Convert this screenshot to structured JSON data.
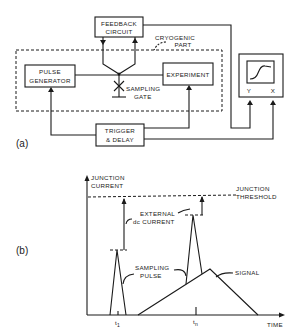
{
  "panel_a": {
    "label": "(a)",
    "blocks": {
      "feedback": [
        "FEEDBACK",
        "CIRCUIT"
      ],
      "pulse_generator": [
        "PULSE",
        "GENERATOR"
      ],
      "experiment": "EXPERIMENT",
      "trigger_delay": [
        "TRIGGER",
        "& DELAY"
      ]
    },
    "cryogenic_label": [
      "CRYOGENIC",
      "PART"
    ],
    "sampling_gate_label": [
      "SAMPLING",
      "GATE"
    ],
    "scope": {
      "y_label": "Y",
      "x_label": "X"
    }
  },
  "panel_b": {
    "label": "(b)",
    "y_axis_label": [
      "JUNCTION",
      "CURRENT"
    ],
    "x_axis_label": "TIME",
    "threshold_label": [
      "JUNCTION",
      "THRESHOLD"
    ],
    "external_label": [
      "EXTERNAL",
      "dc CURRENT"
    ],
    "sampling_pulse_label": [
      "SAMPLING",
      "PULSE"
    ],
    "signal_label": "SIGNAL",
    "ticks": {
      "t1": "t",
      "t1_sub": "1",
      "tn": "t",
      "tn_sub": "n"
    }
  }
}
